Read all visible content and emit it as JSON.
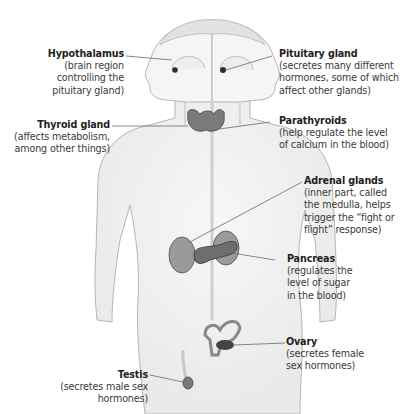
{
  "figure": {
    "colors": {
      "background": "#ffffff",
      "text": "#2a2a2a",
      "body_outline": "#b8b8b8",
      "gland_fill": "#8a8a8a",
      "gland_dark": "#4a4a4a",
      "leader_line": "#6a6a6a"
    },
    "labels": [
      {
        "id": "hypothalamus",
        "title": "Hypothalamus",
        "desc_lines": [
          "(brain region",
          "controlling the",
          "pituitary gland)"
        ],
        "side": "left"
      },
      {
        "id": "pituitary",
        "title": "Pituitary gland",
        "desc_lines": [
          "(secretes many different",
          "hormones, some of which",
          "affect other glands)"
        ],
        "side": "right"
      },
      {
        "id": "thyroid",
        "title": "Thyroid gland",
        "desc_lines": [
          "(affects metabolism,",
          "among other things)"
        ],
        "side": "left"
      },
      {
        "id": "parathyroids",
        "title": "Parathyroids",
        "desc_lines": [
          "(help regulate the level",
          "of calcium in the blood)"
        ],
        "side": "right"
      },
      {
        "id": "adrenal",
        "title": "Adrenal glands",
        "desc_lines": [
          "(inner part, called",
          "the medulla, helps",
          "trigger the “fight or",
          "flight” response)"
        ],
        "side": "right"
      },
      {
        "id": "pancreas",
        "title": "Pancreas",
        "desc_lines": [
          "(regulates the",
          "level of sugar",
          "in the blood)"
        ],
        "side": "right"
      },
      {
        "id": "ovary",
        "title": "Ovary",
        "desc_lines": [
          "(secretes female",
          "sex hormones)"
        ],
        "side": "right"
      },
      {
        "id": "testis",
        "title": "Testis",
        "desc_lines": [
          "(secretes male sex",
          "hormones)"
        ],
        "side": "left"
      }
    ]
  }
}
